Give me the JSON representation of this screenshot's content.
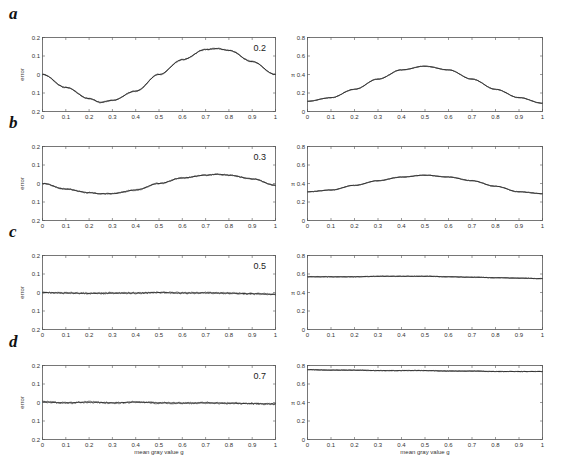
{
  "figure": {
    "panels": [
      {
        "letter": "a",
        "sigma_label": "0.2"
      },
      {
        "letter": "b",
        "sigma_label": "0.3"
      },
      {
        "letter": "c",
        "sigma_label": "0.5"
      },
      {
        "letter": "d",
        "sigma_label": "0.7"
      }
    ],
    "left_ylabel": "error",
    "right_ylabel": "π",
    "xlabel": "mean gray value g",
    "x_ticks": [
      "0",
      "0.1",
      "0.2",
      "0.3",
      "0.4",
      "0.5",
      "0.6",
      "0.7",
      "0.8",
      "0.9",
      "1"
    ],
    "left_y_ticks": [
      "0.2",
      "0.1",
      "0",
      "0.1",
      "0.2"
    ],
    "right_y_ticks": [
      "0.8",
      "0.6",
      "0.4",
      "0.2",
      "0"
    ],
    "line_color": "#333333"
  },
  "chart_data": [
    {
      "panel": "a-left",
      "type": "line",
      "title": "",
      "annotation": "0.2",
      "xlabel": "",
      "ylabel": "error",
      "xlim": [
        0,
        1
      ],
      "ylim": [
        -0.2,
        0.2
      ],
      "grid": false,
      "x": [
        0,
        0.1,
        0.2,
        0.25,
        0.3,
        0.4,
        0.5,
        0.6,
        0.7,
        0.75,
        0.8,
        0.9,
        1
      ],
      "series": [
        {
          "name": "error",
          "values": [
            0,
            -0.07,
            -0.13,
            -0.15,
            -0.14,
            -0.09,
            0,
            0.08,
            0.135,
            0.14,
            0.13,
            0.07,
            0
          ]
        }
      ]
    },
    {
      "panel": "a-right",
      "type": "line",
      "title": "",
      "xlabel": "",
      "ylabel": "π",
      "xlim": [
        0,
        1
      ],
      "ylim": [
        0,
        0.8
      ],
      "grid": false,
      "x": [
        0,
        0.1,
        0.2,
        0.3,
        0.4,
        0.5,
        0.6,
        0.7,
        0.8,
        0.9,
        1
      ],
      "series": [
        {
          "name": "pi",
          "values": [
            0.11,
            0.15,
            0.24,
            0.35,
            0.45,
            0.49,
            0.45,
            0.35,
            0.24,
            0.15,
            0.09
          ]
        }
      ]
    },
    {
      "panel": "b-left",
      "type": "line",
      "title": "",
      "annotation": "0.3",
      "xlabel": "",
      "ylabel": "error",
      "xlim": [
        0,
        1
      ],
      "ylim": [
        -0.2,
        0.2
      ],
      "grid": false,
      "x": [
        0,
        0.1,
        0.2,
        0.25,
        0.3,
        0.4,
        0.5,
        0.6,
        0.7,
        0.75,
        0.8,
        0.9,
        1
      ],
      "series": [
        {
          "name": "error",
          "values": [
            0,
            -0.03,
            -0.05,
            -0.055,
            -0.055,
            -0.035,
            0,
            0.03,
            0.045,
            0.05,
            0.045,
            0.025,
            -0.01
          ]
        }
      ]
    },
    {
      "panel": "b-right",
      "type": "line",
      "title": "",
      "xlabel": "",
      "ylabel": "π",
      "xlim": [
        0,
        1
      ],
      "ylim": [
        0,
        0.8
      ],
      "grid": false,
      "x": [
        0,
        0.1,
        0.2,
        0.3,
        0.4,
        0.5,
        0.6,
        0.7,
        0.8,
        0.9,
        1
      ],
      "series": [
        {
          "name": "pi",
          "values": [
            0.31,
            0.33,
            0.38,
            0.43,
            0.47,
            0.49,
            0.47,
            0.43,
            0.37,
            0.31,
            0.29
          ]
        }
      ]
    },
    {
      "panel": "c-left",
      "type": "line",
      "title": "",
      "annotation": "0.5",
      "xlabel": "",
      "ylabel": "error",
      "xlim": [
        0,
        1
      ],
      "ylim": [
        -0.2,
        0.2
      ],
      "grid": false,
      "x": [
        0,
        0.1,
        0.2,
        0.3,
        0.4,
        0.5,
        0.6,
        0.7,
        0.8,
        0.9,
        1
      ],
      "series": [
        {
          "name": "error",
          "values": [
            0,
            -0.003,
            -0.005,
            -0.004,
            -0.003,
            0,
            -0.003,
            -0.002,
            -0.004,
            -0.006,
            -0.01
          ]
        }
      ]
    },
    {
      "panel": "c-right",
      "type": "line",
      "title": "",
      "xlabel": "",
      "ylabel": "π",
      "xlim": [
        0,
        1
      ],
      "ylim": [
        0,
        0.8
      ],
      "grid": false,
      "x": [
        0,
        0.1,
        0.2,
        0.3,
        0.4,
        0.5,
        0.6,
        0.7,
        0.8,
        0.9,
        1
      ],
      "series": [
        {
          "name": "pi",
          "values": [
            0.57,
            0.57,
            0.57,
            0.575,
            0.575,
            0.575,
            0.57,
            0.565,
            0.56,
            0.555,
            0.55
          ]
        }
      ]
    },
    {
      "panel": "d-left",
      "type": "line",
      "title": "",
      "annotation": "0.7",
      "xlabel": "mean gray value g",
      "ylabel": "error",
      "xlim": [
        0,
        1
      ],
      "ylim": [
        -0.2,
        0.2
      ],
      "grid": false,
      "x": [
        0,
        0.1,
        0.2,
        0.3,
        0.4,
        0.5,
        0.6,
        0.7,
        0.8,
        0.9,
        1
      ],
      "series": [
        {
          "name": "error",
          "values": [
            0.003,
            -0.002,
            0.002,
            -0.002,
            0.002,
            -0.002,
            -0.003,
            -0.002,
            -0.004,
            -0.006,
            -0.008
          ]
        }
      ]
    },
    {
      "panel": "d-right",
      "type": "line",
      "title": "",
      "xlabel": "mean gray value g",
      "ylabel": "π",
      "xlim": [
        0,
        1
      ],
      "ylim": [
        0,
        0.8
      ],
      "grid": false,
      "x": [
        0,
        0.1,
        0.2,
        0.3,
        0.4,
        0.5,
        0.6,
        0.7,
        0.8,
        0.9,
        1
      ],
      "series": [
        {
          "name": "pi",
          "values": [
            0.755,
            0.75,
            0.75,
            0.745,
            0.745,
            0.745,
            0.74,
            0.74,
            0.735,
            0.735,
            0.735
          ]
        }
      ]
    }
  ]
}
